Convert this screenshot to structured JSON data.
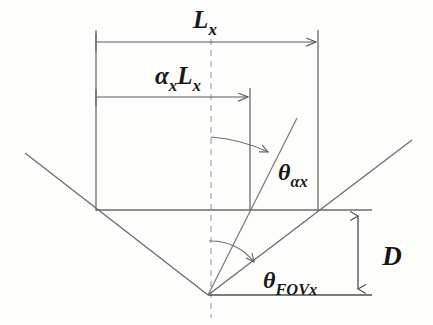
{
  "figure": {
    "background_color": "#fdfdfc",
    "line_color": "#6b6b6b",
    "dark_line_color": "#555555",
    "text_color": "#1a1a1a",
    "width": 433,
    "height": 325
  },
  "labels": {
    "total_width": {
      "base": "L",
      "subscript": "x",
      "full_text": "Lx",
      "x": 205,
      "y": 28
    },
    "partial_width": {
      "prefix_base": "α",
      "prefix_subscript": "x",
      "base": "L",
      "subscript": "x",
      "full_text": "αxLx",
      "x": 178,
      "y": 84
    },
    "angle_alpha": {
      "base": "θ",
      "subscript": "αx",
      "full_text": "θαx",
      "x": 278,
      "y": 180
    },
    "angle_fov": {
      "base": "θ",
      "subscript": "FOVx",
      "full_text": "θFOVx",
      "x": 263,
      "y": 288
    },
    "depth": {
      "base": "D",
      "subscript": "",
      "full_text": "D",
      "x": 392,
      "y": 265
    }
  },
  "geometry": {
    "apex": {
      "x": 208,
      "y": 295
    },
    "centerline": {
      "x": 211,
      "y_top": 28,
      "y_bottom": 318,
      "style": "dashed"
    },
    "upper_horizontal": {
      "x1": 96,
      "x2": 372,
      "y": 210
    },
    "lower_horizontal": {
      "x1": 208,
      "x2": 372,
      "y": 295
    },
    "left_vertical": {
      "x": 96,
      "y_top": 30,
      "y_bottom": 210
    },
    "inner_vertical": {
      "x": 250,
      "y_top": 88,
      "y_bottom": 210
    },
    "right_vertical": {
      "x": 318,
      "y_top": 30,
      "y_bottom": 210
    },
    "left_diagonal": {
      "x1": 25,
      "y1": 153,
      "x2": 208,
      "y2": 295
    },
    "right_diagonal": {
      "x1": 208,
      "y1": 295,
      "x2": 412,
      "y2": 140
    },
    "alpha_ray": {
      "x1": 208,
      "y1": 295,
      "x2": 297,
      "y2": 118
    },
    "dim_line_total": {
      "x1": 96,
      "x2": 318,
      "y": 42
    },
    "dim_line_partial": {
      "x1": 96,
      "x2": 250,
      "y": 97
    },
    "dim_line_depth": {
      "x": 358,
      "y_top": 210,
      "y_bottom": 295
    },
    "arc_alpha": {
      "cx": 208,
      "cy": 295,
      "radius": 160
    },
    "arc_fov": {
      "cx": 208,
      "cy": 295,
      "radius": 54
    }
  }
}
